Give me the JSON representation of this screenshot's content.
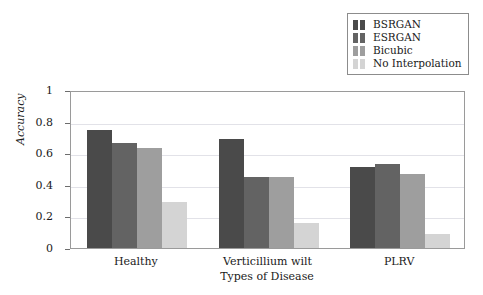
{
  "chart_data": {
    "type": "bar",
    "title": "",
    "xlabel": "Types of Disease",
    "ylabel": "Accuracy",
    "categories": [
      "Healthy",
      "Verticillium wilt",
      "PLRV"
    ],
    "series": [
      {
        "name": "BSRGAN",
        "color": "#4a4a4a",
        "values": [
          0.75,
          0.69,
          0.51
        ]
      },
      {
        "name": "ESRGAN",
        "color": "#636363",
        "values": [
          0.665,
          0.45,
          0.53
        ]
      },
      {
        "name": "Bicubic",
        "color": "#9e9e9e",
        "values": [
          0.63,
          0.45,
          0.47
        ]
      },
      {
        "name": "No Interpolation",
        "color": "#d4d4d4",
        "values": [
          0.29,
          0.16,
          0.09
        ]
      }
    ],
    "ylim": [
      0,
      1
    ],
    "yticks": [
      "0",
      "0.2",
      "0.4",
      "0.6",
      "0.8",
      "1"
    ],
    "ytick_values": [
      0,
      0.2,
      0.4,
      0.6,
      0.8,
      1
    ],
    "grid": true,
    "grid_color": "#e2e2e8",
    "legend_position": "top-right",
    "axis_color": "#9a9a9a",
    "background": "#ffffff"
  }
}
